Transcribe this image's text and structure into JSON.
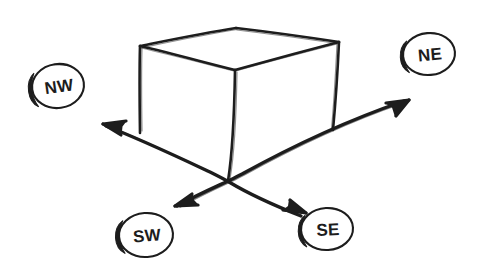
{
  "canvas": {
    "width": 484,
    "height": 278,
    "background_color": "#ffffff",
    "ink_color": "#1d1d1d",
    "style": "hand-drawn pen sketch"
  },
  "figure": {
    "shapes": [
      {
        "name": "cube",
        "type": "wireframe-box",
        "faces_visible": [
          "top",
          "front-left",
          "front-right"
        ]
      },
      {
        "name": "axis-nw-se",
        "type": "double-arrow-line"
      },
      {
        "name": "axis-sw-ne",
        "type": "double-arrow-line"
      }
    ]
  },
  "badges": [
    {
      "id": "nw",
      "label": "NW",
      "direction": "northwest",
      "center_x": 58,
      "center_y": 86,
      "rx": 26,
      "ry": 22,
      "rotation": -8
    },
    {
      "id": "ne",
      "label": "NE",
      "direction": "northeast",
      "center_x": 429,
      "center_y": 54,
      "rx": 26,
      "ry": 21,
      "rotation": -5
    },
    {
      "id": "sw",
      "label": "SW",
      "direction": "southwest",
      "center_x": 146,
      "center_y": 235,
      "rx": 27,
      "ry": 22,
      "rotation": -4
    },
    {
      "id": "se",
      "label": "SE",
      "direction": "southeast",
      "center_x": 327,
      "center_y": 229,
      "rx": 26,
      "ry": 21,
      "rotation": -3
    }
  ],
  "arrows": [
    {
      "id": "arrow-nw",
      "points_to": "NW",
      "tip_x": 103,
      "tip_y": 124
    },
    {
      "id": "arrow-ne",
      "points_to": "NE",
      "tip_x": 409,
      "tip_y": 100
    },
    {
      "id": "arrow-sw",
      "points_to": "SW",
      "tip_x": 175,
      "tip_y": 206
    },
    {
      "id": "arrow-se",
      "points_to": "SE",
      "tip_x": 306,
      "tip_y": 213
    }
  ],
  "cube_vertices": {
    "top_back": {
      "x": 236,
      "y": 28
    },
    "top_left": {
      "x": 140,
      "y": 46
    },
    "top_right": {
      "x": 339,
      "y": 42
    },
    "top_front": {
      "x": 235,
      "y": 70
    },
    "bottom_left": {
      "x": 140,
      "y": 133
    },
    "bottom_right": {
      "x": 333,
      "y": 130
    },
    "bottom_front": {
      "x": 228,
      "y": 181
    }
  }
}
